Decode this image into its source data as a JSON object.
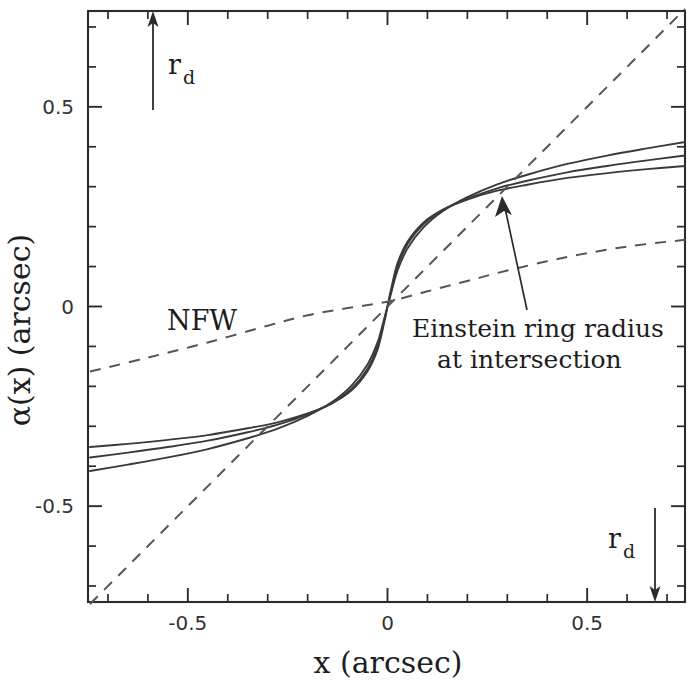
{
  "figure": {
    "background_color": "#ffffff",
    "line_color": "#3a3a3a",
    "dash_color": "#555555"
  },
  "axes": {
    "x_title": "x  (arcsec)",
    "y_title": "α(x)  (arcsec)",
    "x_ticklabels": [
      "-0.5",
      "0",
      "0.5"
    ],
    "y_ticklabels": [
      "0.5",
      "0",
      "-0.5"
    ]
  },
  "annotations": {
    "nfw": "NFW",
    "einstein_line1": "Einstein ring radius",
    "einstein_line2": "at intersection",
    "rd_top": "r",
    "rd_top_sub": "d",
    "rd_bottom": "r",
    "rd_bottom_sub": "d"
  },
  "chart_data": {
    "type": "line",
    "title": "",
    "xlabel": "x  (arcsec)",
    "ylabel": "α(x)  (arcsec)",
    "xlim": [
      -0.75,
      0.745
    ],
    "ylim": [
      -0.74,
      0.74
    ],
    "xticks": [
      -0.5,
      0.0,
      0.5
    ],
    "yticks": [
      0.5,
      0.0,
      -0.5
    ],
    "xtick_labels": [
      "-0.5",
      "0",
      "0.5"
    ],
    "ytick_labels": [
      "0.5",
      "0",
      "-0.5"
    ],
    "minor_tick_spacing": 0.1,
    "grid": false,
    "legend": null,
    "einstein_radius": 0.275,
    "einstein_alpha": 0.268,
    "r_d_value": 0.67,
    "series": [
      {
        "name": "deflection-curve-1",
        "style": "solid",
        "x": [
          -0.745,
          -0.65,
          -0.55,
          -0.45,
          -0.35,
          -0.275,
          -0.2,
          -0.14,
          -0.09,
          -0.05,
          -0.025,
          -0.01,
          0.0,
          0.01,
          0.025,
          0.05,
          0.09,
          0.14,
          0.2,
          0.275,
          0.35,
          0.45,
          0.55,
          0.65,
          0.745
        ],
        "y": [
          -0.352,
          -0.344,
          -0.334,
          -0.322,
          -0.305,
          -0.29,
          -0.268,
          -0.243,
          -0.21,
          -0.162,
          -0.108,
          -0.048,
          0.0,
          0.048,
          0.108,
          0.162,
          0.21,
          0.243,
          0.268,
          0.29,
          0.305,
          0.322,
          0.334,
          0.344,
          0.352
        ]
      },
      {
        "name": "deflection-curve-2",
        "style": "solid",
        "x": [
          -0.745,
          -0.65,
          -0.55,
          -0.45,
          -0.35,
          -0.275,
          -0.2,
          -0.14,
          -0.09,
          -0.05,
          -0.025,
          -0.01,
          0.0,
          0.01,
          0.025,
          0.05,
          0.09,
          0.14,
          0.2,
          0.275,
          0.35,
          0.45,
          0.55,
          0.65,
          0.745
        ],
        "y": [
          -0.378,
          -0.366,
          -0.352,
          -0.336,
          -0.315,
          -0.296,
          -0.27,
          -0.242,
          -0.206,
          -0.156,
          -0.1,
          -0.042,
          0.0,
          0.042,
          0.1,
          0.156,
          0.206,
          0.242,
          0.27,
          0.296,
          0.315,
          0.336,
          0.352,
          0.366,
          0.378
        ]
      },
      {
        "name": "deflection-curve-3",
        "style": "solid",
        "x": [
          -0.745,
          -0.65,
          -0.55,
          -0.45,
          -0.35,
          -0.275,
          -0.2,
          -0.14,
          -0.09,
          -0.05,
          -0.025,
          -0.01,
          0.0,
          0.01,
          0.025,
          0.05,
          0.09,
          0.14,
          0.2,
          0.275,
          0.35,
          0.45,
          0.55,
          0.65,
          0.745
        ],
        "y": [
          -0.412,
          -0.396,
          -0.378,
          -0.357,
          -0.33,
          -0.306,
          -0.274,
          -0.24,
          -0.198,
          -0.145,
          -0.09,
          -0.037,
          0.0,
          0.037,
          0.09,
          0.145,
          0.198,
          0.24,
          0.274,
          0.306,
          0.33,
          0.357,
          0.378,
          0.396,
          0.412
        ]
      },
      {
        "name": "nfw-profile",
        "style": "dashed",
        "x": [
          -0.745,
          -0.6,
          -0.45,
          -0.3,
          -0.2,
          -0.1,
          0.0,
          0.1,
          0.2,
          0.3,
          0.45,
          0.6,
          0.745
        ],
        "y": [
          -0.163,
          -0.128,
          -0.09,
          -0.048,
          -0.022,
          -0.004,
          0.012,
          0.038,
          0.064,
          0.09,
          0.124,
          0.15,
          0.167
        ]
      },
      {
        "name": "unit-slope-line",
        "style": "dashed",
        "x": [
          -0.745,
          0.0,
          0.745
        ],
        "y": [
          -0.745,
          0.0,
          0.745
        ]
      }
    ]
  }
}
